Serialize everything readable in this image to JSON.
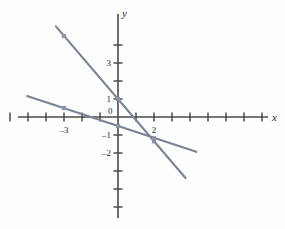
{
  "figure": {
    "background_color": "#ffffff",
    "axis_color": "#4a4a4a",
    "line_color": "#7b8494",
    "marker_color": "#8a94a4",
    "text_color": "#2b2b2b"
  },
  "axes": {
    "x_label": "x",
    "y_label": "y",
    "origin_label": "0",
    "x_tick_labels": [
      "–3",
      "2"
    ],
    "y_tick_labels": [
      "3",
      "1",
      "–1",
      "–2"
    ],
    "x_ticks": [
      -6,
      -5,
      -4,
      -3,
      -2,
      -1,
      1,
      2,
      3,
      4,
      5,
      6,
      7,
      8
    ],
    "y_ticks": [
      4,
      3,
      2,
      1,
      -1,
      -2,
      -3,
      -4,
      -5
    ],
    "x_labeled_ticks": [
      -3,
      2
    ],
    "y_labeled_ticks": [
      3,
      1,
      -1,
      -2
    ],
    "x_range": [
      -6.5,
      9.2
    ],
    "y_range": [
      -5.8,
      6.0
    ],
    "unit_px": 18,
    "origin_px": [
      118,
      117
    ]
  },
  "chart_data": {
    "type": "line",
    "title": "",
    "xlabel": "x",
    "ylabel": "y",
    "xlim": [
      -6.5,
      9.2
    ],
    "ylim": [
      -5.8,
      6.0
    ],
    "grid": false,
    "legend": "none",
    "series": [
      {
        "name": "steep-line",
        "equation": "y = -1.17x + 1",
        "slope": -1.17,
        "intercept": 1,
        "x_endpoints": [
          -3.45,
          3.75
        ],
        "points": [
          {
            "x": -3,
            "y": 4.5
          },
          {
            "x": 0,
            "y": 1
          },
          {
            "x": 2,
            "y": -1.35
          }
        ]
      },
      {
        "name": "shallow-line",
        "equation": "y = -0.33x - 0.5",
        "slope": -0.33,
        "intercept": -0.5,
        "x_endpoints": [
          -5.05,
          4.35
        ],
        "points": [
          {
            "x": -3,
            "y": 0.5
          },
          {
            "x": 0,
            "y": -0.5
          },
          {
            "x": 2,
            "y": -1.18
          }
        ]
      }
    ],
    "intersection": {
      "x": 1.79,
      "y": -1.09
    }
  }
}
